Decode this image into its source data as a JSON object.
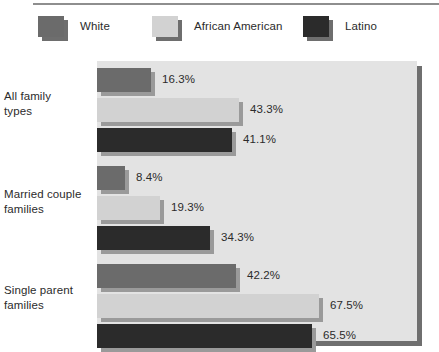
{
  "chart_data": {
    "type": "bar",
    "orientation": "horizontal",
    "title": "",
    "xlabel": "",
    "ylabel": "",
    "grid": false,
    "legend_position": "top",
    "xlim": [
      0,
      67.5
    ],
    "value_suffix": "%",
    "categories": [
      "All family types",
      "Married couple families",
      "Single parent families"
    ],
    "series": [
      {
        "name": "White",
        "color": "#6b6b6b",
        "shadow_color": "#9a9a9a",
        "values": [
          16.3,
          8.4,
          42.2
        ],
        "labels": [
          "16.3%",
          "8.4%",
          "42.2%"
        ]
      },
      {
        "name": "African American",
        "color": "#d2d2d2",
        "shadow_color": "#9a9a9a",
        "values": [
          43.3,
          19.3,
          67.5
        ],
        "labels": [
          "43.3%",
          "19.3%",
          "67.5%"
        ]
      },
      {
        "name": "Latino",
        "color": "#2b2b2b",
        "shadow_color": "#9a9a9a",
        "values": [
          41.1,
          34.3,
          65.5
        ],
        "labels": [
          "41.1%",
          "34.3%",
          "65.5%"
        ]
      }
    ]
  },
  "legend": {
    "items": [
      {
        "label": "White",
        "color": "#6b6b6b"
      },
      {
        "label": "African American",
        "color": "#d2d2d2"
      },
      {
        "label": "Latino",
        "color": "#2b2b2b"
      }
    ]
  },
  "categories": [
    {
      "line1": "All family",
      "line2": "types"
    },
    {
      "line1": "Married couple",
      "line2": "families"
    },
    {
      "line1": "Single parent",
      "line2": "families"
    }
  ]
}
